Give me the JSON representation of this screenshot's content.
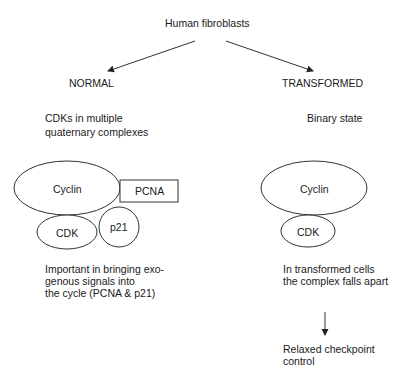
{
  "title": "Human fibroblasts",
  "branches": {
    "normal": {
      "heading": "NORMAL",
      "description": "CDKs in multiple quaternary complexes",
      "description_lines": [
        "CDKs in multiple",
        "quaternary complexes"
      ],
      "complex": {
        "cyclin": "Cyclin",
        "cdk": "CDK",
        "pcna": "PCNA",
        "p21": "p21"
      },
      "note_lines": [
        "Important in bringing exo-",
        "genous signals into",
        "the cycle (PCNA & p21)"
      ]
    },
    "transformed": {
      "heading": "TRANSFORMED",
      "description": "Binary state",
      "complex": {
        "cyclin": "Cyclin",
        "cdk": "CDK"
      },
      "note_lines": [
        "In transformed cells",
        "the complex falls apart"
      ],
      "outcome_lines": [
        "Relaxed checkpoint",
        "control"
      ]
    }
  }
}
